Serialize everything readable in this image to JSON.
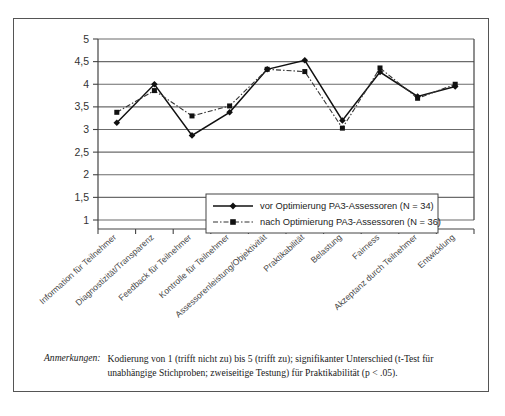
{
  "chart_data": {
    "type": "line",
    "title": "",
    "xlabel": "",
    "ylabel": "",
    "ylim": [
      1,
      5
    ],
    "ytick_step": 0.5,
    "grid": true,
    "legend_position": "inside-center",
    "categories": [
      "Information für Teilnehmer",
      "Diagnostizität/Transparenz",
      "Feedback für Teilnehmer",
      "Kontrolle für Teilnehmer",
      "Assessorenleistung/Objektivität",
      "Praktikabilität",
      "Belastung",
      "Fairness",
      "Akzeptanz durch Teilnehmer",
      "Entwicklung"
    ],
    "ytick_labels": [
      "5",
      "4,5",
      "4",
      "3,5",
      "3",
      "2,5",
      "2",
      "1,5",
      "1"
    ],
    "ytick_values": [
      5,
      4.5,
      4,
      3.5,
      3,
      2.5,
      2,
      1.5,
      1
    ],
    "series": [
      {
        "name": "vor Optimierung PA3-Assessoren (N = 34)",
        "marker": "diamond",
        "style": "solid",
        "color": "#111111",
        "values": [
          3.15,
          4.0,
          2.87,
          3.38,
          4.33,
          4.53,
          3.2,
          4.27,
          3.73,
          3.95
        ]
      },
      {
        "name": "nach Optimierung PA3-Assessoren (N = 36)",
        "marker": "square",
        "style": "dash-dot",
        "color": "#333333",
        "values": [
          3.38,
          3.86,
          3.3,
          3.52,
          4.33,
          4.28,
          3.03,
          4.36,
          3.69,
          4.0
        ]
      }
    ]
  },
  "legend": {
    "entries": [
      "vor Optimierung PA3-Assessoren (N = 34)",
      "nach Optimierung PA3-Assessoren (N = 36)"
    ]
  },
  "note": {
    "label": "Anmerkungen:",
    "body": "Kodierung von 1 (trifft nicht zu) bis 5 (trifft zu); signifikanter Unterschied (t-Test für unabhängige Stichproben; zweiseitige Testung) für Praktikabilität (p < .05)."
  }
}
